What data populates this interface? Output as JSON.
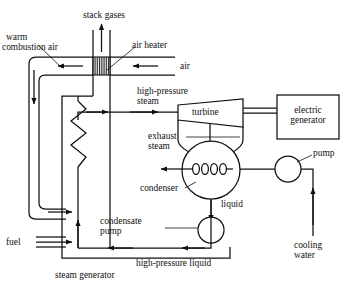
{
  "diagram": {
    "type": "process-flow-diagram",
    "stroke_color": "#000000",
    "background_color": "#ffffff"
  },
  "labels": {
    "stack_gases": "stack gases",
    "warm_combustion_air_l1": "warm",
    "warm_combustion_air_l2": "combustion air",
    "air_heater": "air heater",
    "air": "air",
    "high_pressure_steam_l1": "high-pressure",
    "high_pressure_steam_l2": "steam",
    "turbine": "turbine",
    "electric_generator_l1": "electric",
    "electric_generator_l2": "generator",
    "exhaust_steam_l1": "exhaust",
    "exhaust_steam_l2": "steam",
    "condenser": "condenser",
    "pump": "pump",
    "liquid": "liquid",
    "cooling_water_l1": "cooling",
    "cooling_water_l2": "water",
    "condensate_pump_l1": "condensate",
    "condensate_pump_l2": "pump",
    "fuel": "fuel",
    "high_pressure_liquid": "high-pressure liquid",
    "steam_generator": "steam generator"
  },
  "components": [
    {
      "name": "air-heater",
      "shape": "hatched-rectangle"
    },
    {
      "name": "steam-generator",
      "shape": "rectangle"
    },
    {
      "name": "boiler-tube",
      "shape": "zigzag"
    },
    {
      "name": "turbine",
      "shape": "trapezoid"
    },
    {
      "name": "electric-generator",
      "shape": "rectangle"
    },
    {
      "name": "condenser",
      "shape": "circle-with-coil"
    },
    {
      "name": "cooling-water-pump",
      "shape": "circle"
    },
    {
      "name": "condensate-pump",
      "shape": "circle"
    }
  ],
  "flows": [
    {
      "name": "stack-gases",
      "direction": "up"
    },
    {
      "name": "air-inlet",
      "direction": "left"
    },
    {
      "name": "warm-combustion-air",
      "direction": "left-then-down"
    },
    {
      "name": "fuel-inlet",
      "direction": "right"
    },
    {
      "name": "high-pressure-steam",
      "direction": "right"
    },
    {
      "name": "exhaust-steam",
      "direction": "down"
    },
    {
      "name": "condensate",
      "direction": "down"
    },
    {
      "name": "high-pressure-liquid",
      "direction": "left"
    },
    {
      "name": "cooling-water-in",
      "direction": "up"
    },
    {
      "name": "cooling-water-out",
      "direction": "left"
    }
  ]
}
